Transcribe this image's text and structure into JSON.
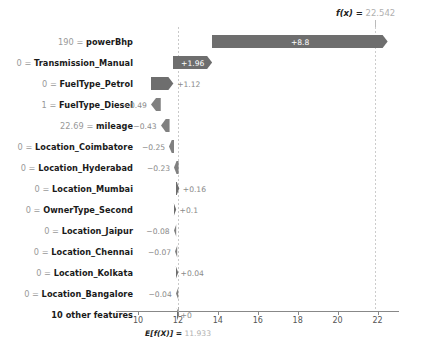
{
  "chart_data": {
    "type": "bar",
    "title": "",
    "xlabel": "",
    "ylabel": "",
    "plot_kind": "shap-waterfall",
    "base_value": 11.933,
    "output_value": 22.542,
    "base_label": "E[f(X)] = 11.933",
    "base_symbol": "E[f(X)]",
    "base_equals": "=",
    "base_number": "11.933",
    "fx_symbol": "f(x)",
    "fx_equals": "=",
    "fx_number": "22.542",
    "xlim": [
      9.0,
      23.3
    ],
    "xticks": [
      10,
      12,
      14,
      16,
      18,
      20,
      22
    ],
    "xticklabels": [
      "10",
      "12",
      "14",
      "16",
      "18",
      "20",
      "22"
    ],
    "grid": false,
    "legend": "none",
    "bar_color_positive": "#6e6e6e",
    "bar_color_negative": "#808080",
    "categories": [
      "190 = powerBhp",
      "0 = Transmission_Manual",
      "0 = FuelType_Petrol",
      "1 = FuelType_Diesel",
      "22.69 = mileage",
      "0 = Location_Coimbatore",
      "0 = Location_Hyderabad",
      "0 = Location_Mumbai",
      "0 = OwnerType_Second",
      "0 = Location_Jaipur",
      "0 = Location_Chennai",
      "0 = Location_Kolkata",
      "0 = Location_Bangalore",
      "10 other features"
    ],
    "values": [
      8.8,
      1.96,
      1.12,
      -0.49,
      -0.43,
      -0.25,
      -0.23,
      0.16,
      0.1,
      -0.08,
      -0.07,
      0.04,
      -0.04,
      0.0
    ]
  },
  "rows": [
    {
      "value": "190",
      "sep": "=",
      "feature": "powerBhp",
      "amount": "+8.8",
      "num": 8.8,
      "inside": true
    },
    {
      "value": "0",
      "sep": "=",
      "feature": "Transmission_Manual",
      "amount": "+1.96",
      "num": 1.96,
      "inside": true
    },
    {
      "value": "0",
      "sep": "=",
      "feature": "FuelType_Petrol",
      "amount": "+1.12",
      "num": 1.12,
      "inside": false
    },
    {
      "value": "1",
      "sep": "=",
      "feature": "FuelType_Diesel",
      "amount": "−0.49",
      "num": -0.49,
      "inside": false
    },
    {
      "value": "22.69",
      "sep": "=",
      "feature": "mileage",
      "amount": "−0.43",
      "num": -0.43,
      "inside": false
    },
    {
      "value": "0",
      "sep": "=",
      "feature": "Location_Coimbatore",
      "amount": "−0.25",
      "num": -0.25,
      "inside": false
    },
    {
      "value": "0",
      "sep": "=",
      "feature": "Location_Hyderabad",
      "amount": "−0.23",
      "num": -0.23,
      "inside": false
    },
    {
      "value": "0",
      "sep": "=",
      "feature": "Location_Mumbai",
      "amount": "+0.16",
      "num": 0.16,
      "inside": false
    },
    {
      "value": "0",
      "sep": "=",
      "feature": "OwnerType_Second",
      "amount": "+0.1",
      "num": 0.1,
      "inside": false
    },
    {
      "value": "0",
      "sep": "=",
      "feature": "Location_Jaipur",
      "amount": "−0.08",
      "num": -0.08,
      "inside": false
    },
    {
      "value": "0",
      "sep": "=",
      "feature": "Location_Chennai",
      "amount": "−0.07",
      "num": -0.07,
      "inside": false
    },
    {
      "value": "0",
      "sep": "=",
      "feature": "Location_Kolkata",
      "amount": "+0.04",
      "num": 0.04,
      "inside": false
    },
    {
      "value": "0",
      "sep": "=",
      "feature": "Location_Bangalore",
      "amount": "−0.04",
      "num": -0.04,
      "inside": false
    },
    {
      "value": "",
      "sep": "",
      "feature": "10 other features",
      "amount": "+0",
      "num": 0.0,
      "inside": false
    }
  ]
}
